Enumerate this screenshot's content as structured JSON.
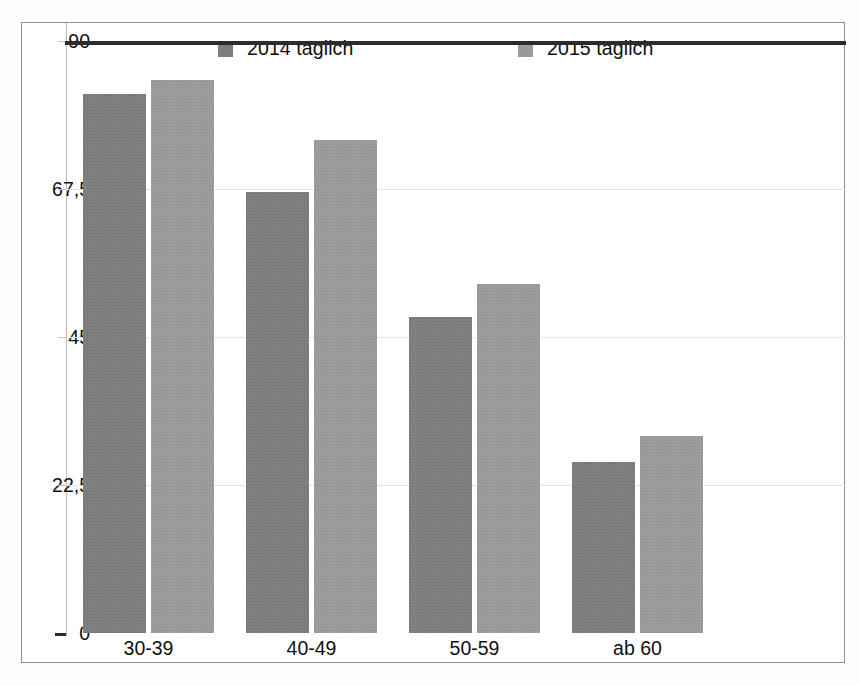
{
  "chart_data": {
    "type": "bar",
    "title": "",
    "subtitle": "",
    "xlabel": "",
    "ylabel": "",
    "categories": [
      "30-39",
      "40-49",
      "50-59",
      "ab 60"
    ],
    "series": [
      {
        "name": "2014 täglich",
        "color": "#7d7d7d",
        "values": [
          82,
          67,
          48,
          26
        ]
      },
      {
        "name": "2015 täglich",
        "color": "#9a9a9a",
        "values": [
          84,
          75,
          53,
          30
        ]
      }
    ],
    "ylim": [
      0,
      90
    ],
    "yticks": [
      0,
      22.5,
      45,
      67.5,
      90
    ],
    "ytick_labels": [
      "0",
      "22,5",
      "45",
      "67,5",
      "90"
    ],
    "grid": true,
    "legend_position": "top"
  },
  "legend": {
    "items": [
      {
        "label": "2014 täglich",
        "color": "#7d7d7d"
      },
      {
        "label": "2015 täglich",
        "color": "#9a9a9a"
      }
    ]
  },
  "axis": {
    "y_labels": [
      "90",
      "67,5",
      "45",
      "22,5",
      "0"
    ],
    "x_labels": [
      "30-39",
      "40-49",
      "50-59",
      "ab 60"
    ]
  },
  "colors": {
    "series_2014": "#7d7d7d",
    "series_2015": "#9a9a9a",
    "gridline": "#e4e4e6",
    "baseline": "#2c2c2e",
    "frame": "#8e9094",
    "text": "#101010",
    "background": "#ffffff"
  }
}
